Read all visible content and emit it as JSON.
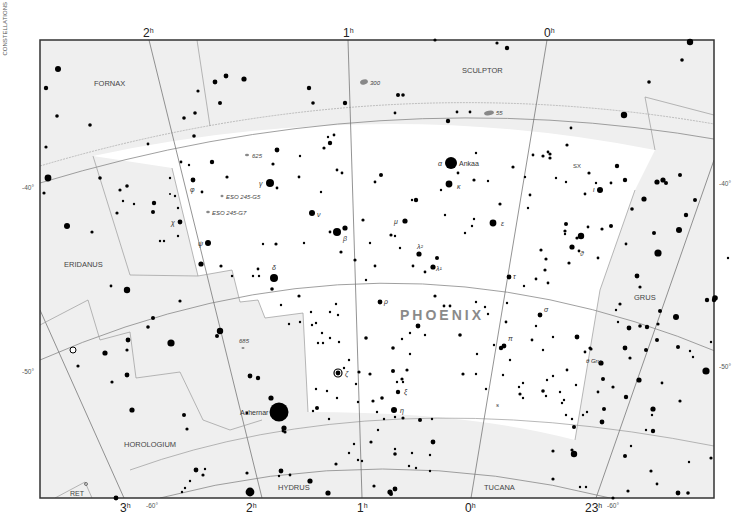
{
  "map": {
    "title": "PHOENIX",
    "side_label": "CONSTELLATIONS",
    "colors": {
      "outside_bg": "#efefef",
      "inside_bg": "#ffffff",
      "frame": "#333333",
      "grid": "#888888",
      "boundary": "#888888",
      "star": "#000000",
      "title": "#8a8a8a",
      "label": "#444444",
      "galaxy": "#888888"
    },
    "ra_labels_top": [
      {
        "text": "2",
        "sup": "h",
        "x": 150
      },
      {
        "text": "1",
        "sup": "h",
        "x": 347
      },
      {
        "text": "0",
        "sup": "h",
        "x": 547
      }
    ],
    "ra_labels_bottom": [
      {
        "text": "3",
        "sup": "h",
        "x": 124
      },
      {
        "text": "2",
        "sup": "h",
        "x": 254
      },
      {
        "text": "1",
        "sup": "h",
        "x": 362
      },
      {
        "text": "0",
        "sup": "h",
        "x": 470
      },
      {
        "text": "23",
        "sup": "h",
        "x": 596
      }
    ],
    "dec_labels": [
      {
        "text": "-40°",
        "x": 22,
        "y": 188,
        "side": "left"
      },
      {
        "text": "-50°",
        "x": 22,
        "y": 373,
        "side": "left"
      },
      {
        "text": "-40°",
        "x": 720,
        "y": 183,
        "side": "right"
      },
      {
        "text": "-50°",
        "x": 720,
        "y": 367,
        "side": "right"
      },
      {
        "text": "-60°",
        "x": 152,
        "y": 506,
        "side": "bottom"
      },
      {
        "text": "-60°",
        "x": 614,
        "y": 506,
        "side": "bottom"
      }
    ],
    "constellations": [
      {
        "name": "FORNAX",
        "x": 113,
        "y": 83
      },
      {
        "name": "SCULPTOR",
        "x": 484,
        "y": 71
      },
      {
        "name": "ERIDANUS",
        "x": 80,
        "y": 264
      },
      {
        "name": "GRUS",
        "x": 644,
        "y": 297
      },
      {
        "name": "HOROLOGIUM",
        "x": 148,
        "y": 444
      },
      {
        "name": "HYDRUS",
        "x": 292,
        "y": 487
      },
      {
        "name": "TUCANA",
        "x": 497,
        "y": 487
      },
      {
        "name": "RET",
        "x": 76,
        "y": 493
      }
    ],
    "named_stars": [
      {
        "label": "Ankaa",
        "greek": "α",
        "x": 451,
        "y": 163,
        "r": 6
      },
      {
        "label": "Achernar",
        "x": 279,
        "y": 412,
        "r": 9
      }
    ],
    "greek_labels": [
      {
        "text": "κ",
        "x": 457,
        "y": 186
      },
      {
        "text": "γ",
        "x": 259,
        "y": 185
      },
      {
        "text": "ν",
        "x": 317,
        "y": 215
      },
      {
        "text": "β",
        "x": 345,
        "y": 239
      },
      {
        "text": "φ",
        "x": 193,
        "y": 189
      },
      {
        "text": "χ",
        "x": 173,
        "y": 223
      },
      {
        "text": "ψ",
        "x": 199,
        "y": 244
      },
      {
        "text": "δ",
        "x": 274,
        "y": 270
      },
      {
        "text": "μ",
        "x": 396,
        "y": 224
      },
      {
        "text": "λ²",
        "x": 416,
        "y": 248
      },
      {
        "text": "λ¹",
        "x": 435,
        "y": 270
      },
      {
        "text": "ε",
        "x": 501,
        "y": 224
      },
      {
        "text": "ι",
        "x": 595,
        "y": 191
      },
      {
        "text": "ϑ",
        "x": 581,
        "y": 255
      },
      {
        "text": "τ",
        "x": 514,
        "y": 278
      },
      {
        "text": "ρ",
        "x": 384,
        "y": 302
      },
      {
        "text": "σ",
        "x": 544,
        "y": 311
      },
      {
        "text": "π",
        "x": 509,
        "y": 340
      },
      {
        "text": "ζ",
        "x": 347,
        "y": 376
      },
      {
        "text": "ξ",
        "x": 405,
        "y": 393
      },
      {
        "text": "η",
        "x": 400,
        "y": 412
      },
      {
        "text": "θ Gru",
        "x": 586,
        "y": 363
      },
      {
        "text": "s",
        "x": 496,
        "y": 406
      }
    ],
    "deep_sky": [
      {
        "label": "300",
        "x": 369,
        "y": 82,
        "type": "galaxy-large"
      },
      {
        "label": "55",
        "x": 495,
        "y": 113,
        "type": "galaxy-large"
      },
      {
        "label": "625",
        "x": 253,
        "y": 155,
        "type": "galaxy"
      },
      {
        "label": "ESO 245-G5",
        "x": 226,
        "y": 196,
        "type": "galaxy"
      },
      {
        "label": "ESO 245-G7",
        "x": 211,
        "y": 212,
        "type": "galaxy"
      },
      {
        "label": "SX",
        "x": 570,
        "y": 165,
        "type": "variable"
      },
      {
        "label": "685",
        "x": 243,
        "y": 340,
        "type": "galaxy"
      }
    ]
  }
}
